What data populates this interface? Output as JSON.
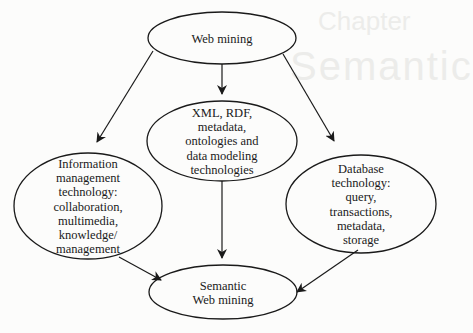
{
  "diagram": {
    "nodes": [
      {
        "id": "web_mining",
        "lines": [
          "Web mining"
        ],
        "cx": 222,
        "cy": 38,
        "rx": 74,
        "ry": 26
      },
      {
        "id": "xml_rdf",
        "lines": [
          "XML, RDF,",
          "metadata,",
          "ontologies and",
          "data modeling",
          "technologies"
        ],
        "cx": 222,
        "cy": 141,
        "rx": 75,
        "ry": 40
      },
      {
        "id": "info_mgmt",
        "lines": [
          "Information",
          "management",
          "technology:",
          "collaboration,",
          "multimedia,",
          "knowledge/",
          "management"
        ],
        "cx": 88,
        "cy": 206,
        "rx": 74,
        "ry": 53
      },
      {
        "id": "database",
        "lines": [
          "Database",
          "technology:",
          "query,",
          "transactions,",
          "metadata,",
          "storage"
        ],
        "cx": 361,
        "cy": 204,
        "rx": 75,
        "ry": 49
      },
      {
        "id": "semantic_web_mining",
        "lines": [
          "Semantic",
          "Web mining"
        ],
        "cx": 223,
        "cy": 292,
        "rx": 74,
        "ry": 27
      }
    ],
    "edges": [
      {
        "from": "web_mining",
        "to": "xml_rdf",
        "x1": 222,
        "y1": 64,
        "x2": 222,
        "y2": 94
      },
      {
        "from": "web_mining",
        "to": "info_mgmt",
        "x1": 153,
        "y1": 51,
        "x2": 97,
        "y2": 142
      },
      {
        "from": "web_mining",
        "to": "database",
        "x1": 283,
        "y1": 54,
        "x2": 334,
        "y2": 141
      },
      {
        "from": "xml_rdf",
        "to": "semantic_web_mining",
        "x1": 222,
        "y1": 181,
        "x2": 222,
        "y2": 258
      },
      {
        "from": "info_mgmt",
        "to": "semantic_web_mining",
        "x1": 119,
        "y1": 257,
        "x2": 161,
        "y2": 280
      },
      {
        "from": "database",
        "to": "semantic_web_mining",
        "x1": 358,
        "y1": 250,
        "x2": 297,
        "y2": 292
      }
    ],
    "colors": {
      "stroke": "#1a1a1a",
      "background": "#fcfcfb"
    }
  },
  "labels": {
    "web_mining": [
      "Web mining"
    ],
    "xml_rdf": [
      "XML, RDF,",
      "metadata,",
      "ontologies and",
      "data modeling",
      "technologies"
    ],
    "info_mgmt": [
      "Information",
      "management",
      "technology:",
      "collaboration,",
      "multimedia,",
      "knowledge/",
      "management"
    ],
    "database": [
      "Database",
      "technology:",
      "query,",
      "transactions,",
      "metadata,",
      "storage"
    ],
    "semantic_web_mining": [
      "Semantic",
      "Web mining"
    ]
  }
}
